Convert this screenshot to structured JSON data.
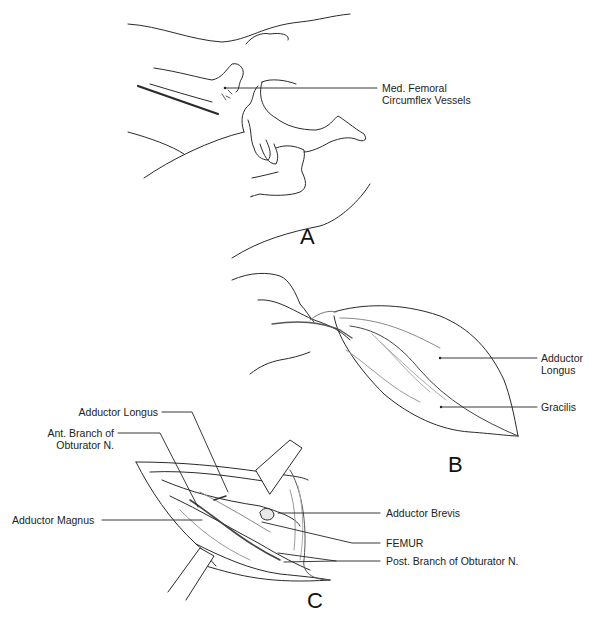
{
  "figure": {
    "panels": [
      {
        "id": "A",
        "letter": "A",
        "labels": [
          {
            "line1": "Med. Femoral",
            "line2": "Circumflex Vessels"
          }
        ]
      },
      {
        "id": "B",
        "letter": "B",
        "labels": [
          {
            "line1": "Adductor",
            "line2": "Longus"
          },
          {
            "line1": "Gracilis"
          }
        ]
      },
      {
        "id": "C",
        "letter": "C",
        "labels": [
          {
            "line1": "Adductor Longus"
          },
          {
            "line1": "Ant. Branch of",
            "line2": "Obturator N."
          },
          {
            "line1": "Adductor Magnus"
          },
          {
            "line1": "Adductor Brevis"
          },
          {
            "line1": "FEMUR"
          },
          {
            "line1": "Post. Branch of Obturator N."
          }
        ]
      }
    ],
    "colors": {
      "background": "#ffffff",
      "ink": "#1a1a1a",
      "shading": "#8a8a8a"
    }
  }
}
